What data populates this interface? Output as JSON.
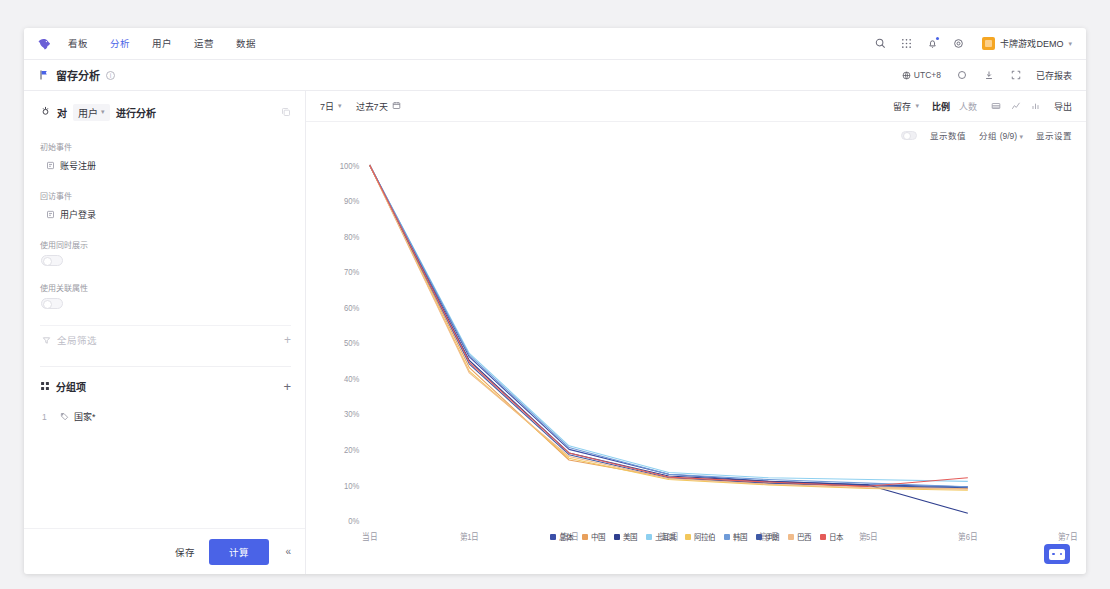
{
  "topnav": {
    "logo_icon": "bird-logo-icon",
    "items": [
      {
        "label": "看板",
        "active": false
      },
      {
        "label": "分析",
        "active": true
      },
      {
        "label": "用户",
        "active": false
      },
      {
        "label": "运营",
        "active": false
      },
      {
        "label": "数据",
        "active": false
      }
    ],
    "icons": [
      "search-icon",
      "apps-grid-icon",
      "notification-bell-icon",
      "settings-gear-icon"
    ],
    "account_name": "卡牌游戏DEMO",
    "account_caret": "▾"
  },
  "pagehead": {
    "flag_icon": "flag-icon",
    "title": "留存分析",
    "info_icon": "info-circle-icon",
    "timezone": "UTC+8",
    "refresh_icon": "refresh-icon",
    "download_icon": "download-icon",
    "fullscreen_icon": "expand-icon",
    "saved_reports": "已存报表"
  },
  "leftpanel": {
    "title_prefix": "对",
    "object": "用户",
    "object_caret": "▾",
    "title_suffix": "进行分析",
    "copy_icon": "copy-icon",
    "fields": [
      {
        "label": "初始事件",
        "value": "账号注册",
        "icon": "event-icon"
      },
      {
        "label": "回访事件",
        "value": "用户登录",
        "icon": "event-icon"
      }
    ],
    "toggles": [
      {
        "label": "使用同时展示",
        "on": false
      },
      {
        "label": "使用关联属性",
        "on": false
      }
    ],
    "global_filter": {
      "label": "全局筛选",
      "icon": "filter-icon",
      "add": "+"
    },
    "group_section": {
      "icon": "group-icon",
      "title": "分组项",
      "add": "+",
      "rows": [
        {
          "index": "1",
          "icon": "tag-icon",
          "label": "国家*"
        }
      ]
    },
    "footer": {
      "save_label": "保存",
      "calc_label": "计算",
      "collapse": "«"
    }
  },
  "toolbar": {
    "period": "7日",
    "period_caret": "▾",
    "daterange": "过去7天",
    "calendar_icon": "calendar-icon",
    "metric": "留存",
    "metric_caret": "▾",
    "segments": [
      {
        "label": "比例",
        "active": true
      },
      {
        "label": "人数",
        "active": false
      }
    ],
    "view_icons": [
      "table-view-icon",
      "line-chart-icon",
      "bar-chart-icon"
    ],
    "export_label": "导出"
  },
  "subbar": {
    "show_values_toggle": {
      "label": "显示数值",
      "on": false
    },
    "group_select": "分组 (9/9)",
    "group_caret": "▾",
    "display_settings": "显示设置"
  },
  "chart_data": {
    "type": "line",
    "title": "",
    "xlabel": "",
    "ylabel": "",
    "ylim": [
      0,
      100
    ],
    "ytick_labels": [
      "100%",
      "90%",
      "80%",
      "70%",
      "60%",
      "50%",
      "40%",
      "30%",
      "20%",
      "10%",
      "0%"
    ],
    "ytick_values": [
      100,
      90,
      80,
      70,
      60,
      50,
      40,
      30,
      20,
      10,
      0
    ],
    "categories": [
      "当日",
      "第1日",
      "第2日",
      "第3日",
      "第4日",
      "第5日",
      "第6日",
      "第7日"
    ],
    "grid": false,
    "legend_position": "bottom",
    "series": [
      {
        "name": "总体",
        "color": "#3b4fa8",
        "values": [
          100,
          46,
          20,
          13,
          11,
          10,
          9.5,
          null
        ]
      },
      {
        "name": "中国",
        "color": "#e8a05c",
        "values": [
          100,
          43,
          17,
          12,
          10.5,
          9.5,
          9,
          null
        ]
      },
      {
        "name": "美国",
        "color": "#2f3f8f",
        "values": [
          100,
          45,
          19,
          12.5,
          11,
          10,
          2,
          null
        ]
      },
      {
        "name": "土耳其",
        "color": "#8ed0f0",
        "values": [
          100,
          47,
          21,
          13.5,
          12,
          11.5,
          11,
          null
        ]
      },
      {
        "name": "阿拉伯",
        "color": "#f2c75c",
        "values": [
          100,
          42,
          17.5,
          11.5,
          10,
          9,
          8.5,
          null
        ]
      },
      {
        "name": "韩国",
        "color": "#6f9bd8",
        "values": [
          100,
          46.5,
          20.5,
          13,
          11.5,
          10.5,
          9.5,
          null
        ]
      },
      {
        "name": "伊朗",
        "color": "#3f5aa6",
        "values": [
          100,
          44,
          18.5,
          12,
          10.5,
          9.8,
          9.2,
          null
        ]
      },
      {
        "name": "巴西",
        "color": "#f0bb8a",
        "values": [
          100,
          41.5,
          18,
          11.8,
          10.2,
          9.2,
          8.8,
          null
        ]
      },
      {
        "name": "日本",
        "color": "#e45b58",
        "values": [
          100,
          44.5,
          19,
          12.2,
          10.8,
          9.6,
          12,
          null
        ]
      }
    ]
  }
}
